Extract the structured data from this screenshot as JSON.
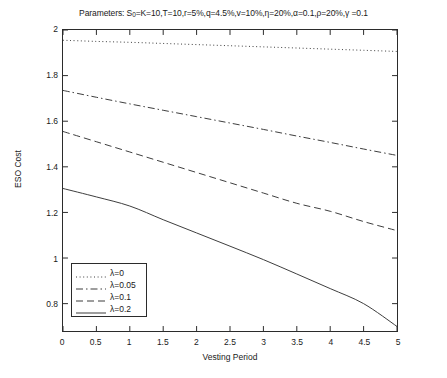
{
  "chart_data": {
    "type": "line",
    "title": "Parameters: S0=K=10,T=10,r=5%,q=4.5%,v=10%,η=20%,α=0.1,ρ=20%,γ =0.1",
    "title_parts": {
      "prefix": "Parameters: S",
      "subscript": "0",
      "rest": "=K=10,T=10,r=5%,q=4.5%,v=10%,η=20%,α=0.1,ρ=20%,γ =0.1"
    },
    "xlabel": "Vesting Period",
    "ylabel": "ESO Cost",
    "xlim": [
      0,
      5
    ],
    "ylim": [
      0.68,
      2.0
    ],
    "grid": false,
    "legend_position": "lower-left",
    "xticks": [
      "0",
      "0.5",
      "1",
      "1.5",
      "2",
      "2.5",
      "3",
      "3.5",
      "4",
      "4.5",
      "5"
    ],
    "xtick_values": [
      0,
      0.5,
      1,
      1.5,
      2,
      2.5,
      3,
      3.5,
      4,
      4.5,
      5
    ],
    "yticks": [
      "0.8",
      "1",
      "1.2",
      "1.4",
      "1.6",
      "1.8",
      "2"
    ],
    "ytick_values": [
      0.8,
      1.0,
      1.2,
      1.4,
      1.6,
      1.8,
      2.0
    ],
    "x": [
      0,
      0.5,
      1,
      1.5,
      2,
      2.5,
      3,
      3.5,
      4,
      4.5,
      5
    ],
    "series": [
      {
        "name": "λ=0",
        "style": "dotted",
        "color": "#3c3c3c",
        "values": [
          1.955,
          1.95,
          1.946,
          1.941,
          1.936,
          1.931,
          1.926,
          1.921,
          1.916,
          1.911,
          1.906
        ]
      },
      {
        "name": "λ=0.05",
        "style": "dash-dot",
        "color": "#3c3c3c",
        "values": [
          1.735,
          1.705,
          1.676,
          1.648,
          1.62,
          1.592,
          1.564,
          1.535,
          1.507,
          1.478,
          1.45
        ]
      },
      {
        "name": "λ=0.1",
        "style": "dashed",
        "color": "#3c3c3c",
        "values": [
          1.555,
          1.51,
          1.465,
          1.42,
          1.375,
          1.33,
          1.285,
          1.24,
          1.205,
          1.16,
          1.12
        ]
      },
      {
        "name": "λ=0.2",
        "style": "solid",
        "color": "#3c3c3c",
        "values": [
          1.305,
          1.268,
          1.228,
          1.168,
          1.11,
          1.052,
          0.993,
          0.93,
          0.866,
          0.8,
          0.7
        ]
      }
    ]
  },
  "legend": {
    "items": [
      {
        "label": "λ=0"
      },
      {
        "label": "λ=0.05"
      },
      {
        "label": "λ=0.1"
      },
      {
        "label": "λ=0.2"
      }
    ]
  }
}
